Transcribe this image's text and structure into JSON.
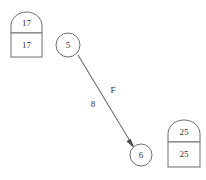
{
  "diagram": {
    "background_color": "#ffffff",
    "stroke_color": "#6e6e6e",
    "text_color": "#333333",
    "width": 206,
    "height": 180,
    "nodes": [
      {
        "id": "house-left",
        "kind": "house",
        "arch_label": "17",
        "box_label": "17",
        "x": 11,
        "y": 12,
        "width": 31,
        "height": 45
      },
      {
        "id": "circle-5",
        "kind": "circle",
        "label": "5",
        "cx": 68,
        "cy": 45,
        "r": 12
      },
      {
        "id": "circle-6",
        "kind": "circle",
        "label": "6",
        "cx": 141,
        "cy": 155,
        "r": 11
      },
      {
        "id": "house-right",
        "kind": "house",
        "arch_label": "25",
        "box_label": "25",
        "x": 168,
        "y": 120,
        "width": 32,
        "height": 47
      }
    ],
    "edges": [
      {
        "id": "edge-5-to-6",
        "from": "circle-5",
        "to": "circle-6",
        "label_name": "F",
        "label_weight": "8",
        "x1": 78,
        "y1": 55,
        "x2": 133,
        "y2": 146,
        "name_label_x": 113,
        "name_label_y": 91,
        "weight_label_x": 93,
        "weight_label_y": 105,
        "arrow": true
      }
    ]
  }
}
